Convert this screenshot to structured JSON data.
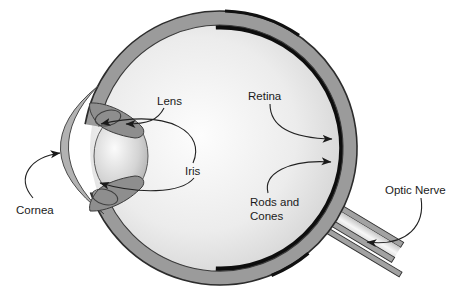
{
  "labels": {
    "lens": "Lens",
    "retina": "Retina",
    "iris": "Iris",
    "cornea": "Cornea",
    "rods_and_cones_line1": "Rods and",
    "rods_and_cones_line2": "Cones",
    "optic_nerve": "Optic Nerve"
  },
  "colors": {
    "background": "#ffffff",
    "ink": "#1b1b1b",
    "sclera_gray": "#9b9b9b",
    "retina_black": "#0d0d0d",
    "iris_gray": "#8e8e8e",
    "cornea_gray": "#b2b2b2",
    "nerve_gray": "#a2a2a2"
  }
}
